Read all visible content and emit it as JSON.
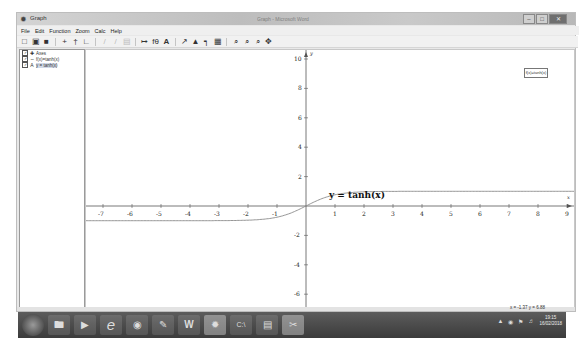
{
  "window": {
    "title": "Graph",
    "document_title": "Graph - Microsoft Word",
    "controls": [
      "minimize",
      "maximize",
      "close"
    ]
  },
  "menu": [
    "File",
    "Edit",
    "Function",
    "Zoom",
    "Calc",
    "Help"
  ],
  "toolbar": {
    "buttons": [
      {
        "name": "new-icon",
        "glyph": "□"
      },
      {
        "name": "open-icon",
        "glyph": "▣"
      },
      {
        "name": "save-icon",
        "glyph": "■"
      },
      {
        "name": "insert-function-icon",
        "glyph": "+"
      },
      {
        "name": "insert-tangent-icon",
        "glyph": "†"
      },
      {
        "name": "insert-series-icon",
        "glyph": "∟"
      },
      {
        "name": "edit-icon",
        "glyph": "/",
        "disabled": true
      },
      {
        "name": "delete-icon",
        "glyph": "/",
        "disabled": true
      },
      {
        "name": "properties-icon",
        "glyph": "▤",
        "disabled": true
      },
      {
        "name": "insert-shading-icon",
        "glyph": "↦"
      },
      {
        "name": "insert-relation-icon",
        "glyph": "fθ"
      },
      {
        "name": "insert-label-icon",
        "glyph": "A"
      },
      {
        "name": "insert-point-series-icon",
        "glyph": "↗"
      },
      {
        "name": "insert-area-icon",
        "glyph": "▲"
      },
      {
        "name": "insert-trendline-icon",
        "glyph": "┑"
      },
      {
        "name": "table-icon",
        "glyph": "▦"
      },
      {
        "name": "zoom-in-icon",
        "glyph": "⌕"
      },
      {
        "name": "zoom-out-icon",
        "glyph": "⌕"
      },
      {
        "name": "zoom-standard-icon",
        "glyph": "⌕"
      },
      {
        "name": "move-icon",
        "glyph": "✥"
      }
    ]
  },
  "sidebar": {
    "items": [
      {
        "label": "Axes",
        "checked": true,
        "icon": "axes-icon"
      },
      {
        "label": "f(x)=tanh(x)",
        "checked": true,
        "icon": "function-icon"
      },
      {
        "label": "y = tanh(x)",
        "checked": true,
        "icon": "label-icon",
        "selected": true
      }
    ]
  },
  "graph": {
    "legend_text": "f(x)=tanh(x)",
    "function_label": "y = tanh(x)",
    "x_axis_name": "x",
    "y_axis_name": "y",
    "x_ticks": [
      "-7",
      "-6",
      "-5",
      "-4",
      "-3",
      "-2",
      "-1",
      "1",
      "2",
      "3",
      "4",
      "5",
      "6",
      "7",
      "8",
      "9"
    ],
    "y_ticks": [
      "10",
      "8",
      "6",
      "4",
      "2",
      "-2",
      "-4",
      "-6"
    ]
  },
  "status": {
    "coords": "x = -1.37   y = 6.88"
  },
  "taskbar": {
    "apps": [
      "start-button",
      "file-explorer",
      "media-player",
      "internet-explorer",
      "chrome",
      "paint",
      "word",
      "graph",
      "command-prompt",
      "notepad",
      "snipping-tool"
    ],
    "clock_time": "19:15",
    "clock_date": "16/02/2018"
  },
  "chart_data": {
    "type": "line",
    "title": "y = tanh(x)",
    "xlabel": "x",
    "ylabel": "y",
    "xlim": [
      -7.7,
      9.5
    ],
    "ylim": [
      -6.8,
      10.5
    ],
    "grid": false,
    "legend": [
      "f(x)=tanh(x)"
    ],
    "legend_position": "top-right",
    "series": [
      {
        "name": "f(x)=tanh(x)",
        "x": [
          -7,
          -6,
          -5,
          -4,
          -3,
          -2,
          -1.5,
          -1,
          -0.5,
          0,
          0.5,
          1,
          1.5,
          2,
          3,
          4,
          5,
          6,
          7,
          8,
          9
        ],
        "values": [
          -1.0,
          -1.0,
          -1.0,
          -0.999,
          -0.995,
          -0.964,
          -0.905,
          -0.762,
          -0.462,
          0,
          0.462,
          0.762,
          0.905,
          0.964,
          0.995,
          0.999,
          1.0,
          1.0,
          1.0,
          1.0,
          1.0
        ]
      }
    ]
  }
}
